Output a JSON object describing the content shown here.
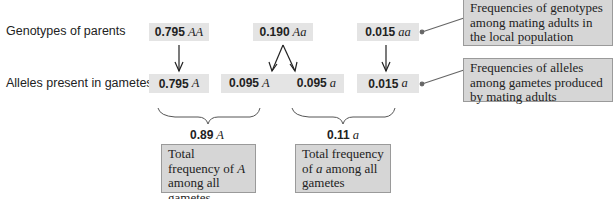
{
  "rows": {
    "parents_label": "Genotypes of parents",
    "gametes_label": "Alleles present in gametes"
  },
  "genotypes": [
    {
      "value": "0.795",
      "symbol": "AA"
    },
    {
      "value": "0.190",
      "symbol": "Aa"
    },
    {
      "value": "0.015",
      "symbol": "aa"
    }
  ],
  "gametes": [
    {
      "value": "0.795",
      "symbol": "A"
    },
    {
      "value": "0.095",
      "symbol": "A"
    },
    {
      "value": "0.095",
      "symbol": "a"
    },
    {
      "value": "0.015",
      "symbol": "a"
    }
  ],
  "totals": [
    {
      "value": "0.89",
      "symbol": "A",
      "caption_pre": "Total frequency of ",
      "caption_sym": "A",
      "caption_post": " among all gametes"
    },
    {
      "value": "0.11",
      "symbol": "a",
      "caption_pre": "Total frequency of ",
      "caption_sym": "a",
      "caption_post": " among all gametes"
    }
  ],
  "callouts": {
    "genotypes": "Frequencies of genotypes among mating adults in the local population",
    "alleles": "Frequencies of alleles among gametes produced by mating adults"
  }
}
